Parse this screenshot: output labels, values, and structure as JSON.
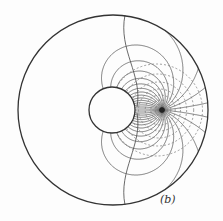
{
  "figure": {
    "label": "(b)",
    "type": "field-line diagram"
  },
  "geometry": {
    "outer_circle": {
      "cx": 113,
      "cy": 110,
      "r": 95
    },
    "inner_circle": {
      "cx": 112,
      "cy": 110,
      "r": 23
    },
    "source_point": {
      "cx": 162,
      "cy": 110
    },
    "label_pos": {
      "x": 160,
      "y": 203
    }
  },
  "colors": {
    "stroke": "#333333",
    "dashed": "#777777",
    "background": "#fdfdfd"
  }
}
